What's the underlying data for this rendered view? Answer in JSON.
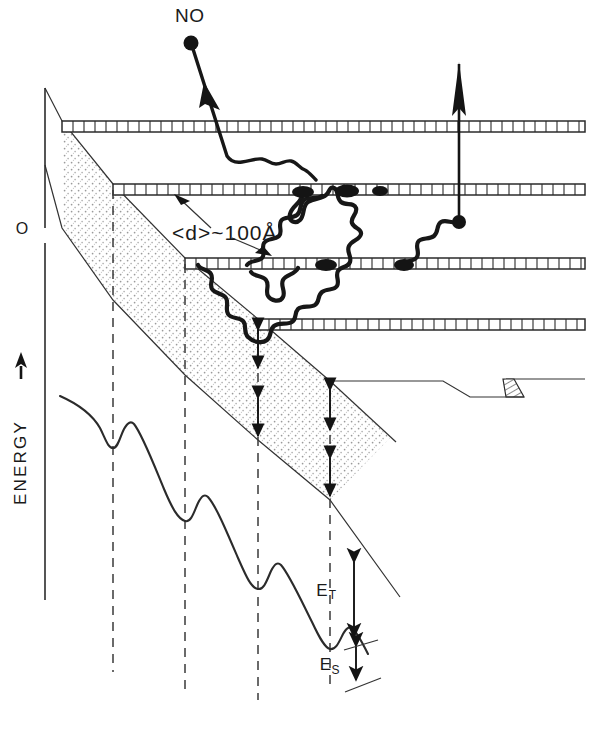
{
  "figure": {
    "background_color": "#ffffff",
    "ink_color": "#1a1a1a"
  },
  "axis": {
    "y_label": "ENERGY",
    "y_label_arrow": "→",
    "origin_label": "O",
    "direction": "increasing upward"
  },
  "annotations": {
    "incoming_species": "NO",
    "spacing_label": "<d>~100Å",
    "spacing_label_parts": {
      "bracket_open": "<",
      "symbol": "d",
      "bracket_close": ">",
      "approx": "~",
      "value": "100",
      "unit": "Å"
    },
    "barrier_energy": "E",
    "barrier_energy_subscript": "T",
    "site_energy": "E",
    "site_energy_subscript": "S"
  },
  "layers": {
    "count": 4,
    "description": "ladder-hatched lamellae",
    "rows": [
      {
        "index": 1,
        "x_start": 62,
        "y": 121,
        "x_end": 585,
        "segments": 48
      },
      {
        "index": 2,
        "x_start": 113,
        "y": 184,
        "x_end": 585,
        "segments": 44
      },
      {
        "index": 3,
        "x_start": 185,
        "y": 258,
        "x_end": 585,
        "segments": 40
      },
      {
        "index": 4,
        "x_start": 258,
        "y": 319,
        "x_end": 585,
        "segments": 34
      }
    ]
  },
  "staircase": {
    "description": "descending stepped potential envelope, upper and lower edges with stippled band between",
    "step_x": [
      62,
      113,
      185,
      258,
      330
    ],
    "upper_y": [
      121,
      184,
      258,
      319,
      381
    ],
    "lower_y": [
      228,
      300,
      375,
      440,
      500
    ]
  },
  "guides": {
    "dashed_x": [
      113,
      185,
      258,
      330
    ],
    "dashed_y_top": [
      190,
      264,
      325,
      387
    ],
    "dashed_y_bottom": [
      672,
      690,
      700,
      690
    ]
  },
  "energy_curve": {
    "type": "potential-well staircase",
    "well_x": [
      113,
      185,
      258,
      330
    ],
    "well_depth_y": [
      448,
      523,
      590,
      650
    ],
    "barrier_peak_y": [
      425,
      498,
      562,
      627
    ]
  },
  "trajectory": {
    "label": "NO",
    "start": {
      "x": 191,
      "y": 36
    },
    "description": "NO molecule enters, threads through layer 1, diffuses laterally, then escapes upward"
  },
  "escape_arrow": {
    "from": {
      "x": 459,
      "y": 222
    },
    "to": {
      "x": 459,
      "y": 62
    },
    "description": "upward escape arrow through the layers"
  },
  "chain": {
    "description": "wandering polymer chain loops between layer 2 and layer 3 with dark anchoring blobs"
  },
  "right_step": {
    "description": "small flat shelf with a hatched wedge at far right of the band"
  },
  "colors": {
    "ink": "#1a1a1a",
    "line": "#2b2b2b",
    "stipple": "#8d8d8d",
    "paper": "#ffffff"
  }
}
